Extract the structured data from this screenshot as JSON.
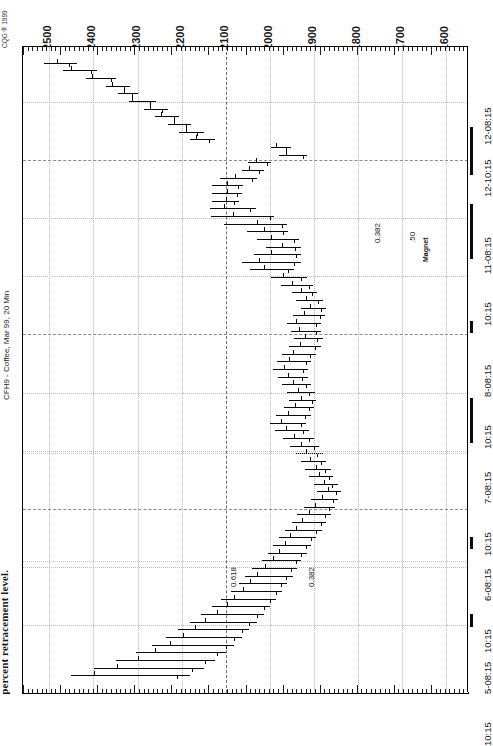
{
  "meta": {
    "copyright": "CQG ® 1999",
    "instrument": "CFH9 - Coffee, Mar 99, 20 Min",
    "caption_fragment": "percent retracement level."
  },
  "chart_data": {
    "type": "bar",
    "subtype": "ohlc-bar-chart-rotated-90",
    "title": "CFH9 - Coffee, Mar 99, 20 Min",
    "xlabel": "",
    "ylabel": "",
    "grid": true,
    "legend": "none",
    "orientation": "rotated-90-ccw",
    "price_axis": {
      "position": "top",
      "labels": [
        "12500",
        "12400",
        "12300",
        "12200",
        "12100",
        "12000",
        "11900",
        "11800",
        "11700",
        "11600"
      ],
      "values": [
        12500,
        12400,
        12300,
        12200,
        12100,
        12000,
        11900,
        11800,
        11700,
        11600
      ],
      "min": 11550,
      "max": 12560
    },
    "time_axis": {
      "position": "right",
      "labels": [
        "12-08:15",
        "12-10:15",
        "11-08:15",
        "10:15",
        "8-08:15",
        "10:15",
        "7-08:15",
        "10:15",
        "6-08:15",
        "10:15",
        "5-08:15",
        "10:15"
      ],
      "sessions": [
        "5-08:15",
        "6-08:15",
        "7-08:15",
        "8-08:15",
        "11-08:15",
        "12-08:15"
      ]
    },
    "annotations": [
      {
        "text": "0.618",
        "kind": "fibonacci-retracement"
      },
      {
        "text": "0.382",
        "kind": "fibonacci-retracement"
      },
      {
        "text": "0.382",
        "kind": "fibonacci-retracement"
      },
      {
        "text": ".50",
        "kind": "fibonacci-retracement"
      },
      {
        "text": "Magnet",
        "kind": "magnet-label"
      }
    ],
    "bars": [
      {
        "t": 0,
        "o": 12482,
        "h": 12512,
        "l": 12437,
        "c": 12455
      },
      {
        "t": 1,
        "o": 12452,
        "h": 12470,
        "l": 12392,
        "c": 12405
      },
      {
        "t": 2,
        "o": 12404,
        "h": 12418,
        "l": 12350,
        "c": 12360
      },
      {
        "t": 3,
        "o": 12358,
        "h": 12372,
        "l": 12318,
        "c": 12330
      },
      {
        "t": 4,
        "o": 12330,
        "h": 12344,
        "l": 12300,
        "c": 12312
      },
      {
        "t": 5,
        "o": 12312,
        "h": 12320,
        "l": 12258,
        "c": 12272
      },
      {
        "t": 6,
        "o": 12272,
        "h": 12285,
        "l": 12232,
        "c": 12245
      },
      {
        "t": 7,
        "o": 12246,
        "h": 12260,
        "l": 12206,
        "c": 12218
      },
      {
        "t": 8,
        "o": 12218,
        "h": 12232,
        "l": 12178,
        "c": 12190
      },
      {
        "t": 9,
        "o": 12190,
        "h": 12205,
        "l": 12150,
        "c": 12166
      },
      {
        "t": 10,
        "o": 12168,
        "h": 12182,
        "l": 12124,
        "c": 12138
      },
      {
        "t": 11,
        "o": 11986,
        "h": 11998,
        "l": 11952,
        "c": 11963
      },
      {
        "t": 12,
        "o": 11964,
        "h": 11980,
        "l": 11916,
        "c": 11925
      },
      {
        "t": 13,
        "o": 12032,
        "h": 12050,
        "l": 11996,
        "c": 12006
      },
      {
        "t": 14,
        "o": 12046,
        "h": 12062,
        "l": 12012,
        "c": 12024
      },
      {
        "t": 15,
        "o": 12078,
        "h": 12112,
        "l": 12030,
        "c": 12040
      },
      {
        "t": 16,
        "o": 12096,
        "h": 12130,
        "l": 12060,
        "c": 12072
      },
      {
        "t": 17,
        "o": 12098,
        "h": 12132,
        "l": 12062,
        "c": 12074
      },
      {
        "t": 18,
        "o": 12100,
        "h": 12130,
        "l": 12070,
        "c": 12080
      },
      {
        "t": 19,
        "o": 12104,
        "h": 12136,
        "l": 12032,
        "c": 12044
      },
      {
        "t": 20,
        "o": 12084,
        "h": 12134,
        "l": 11990,
        "c": 12000
      },
      {
        "t": 21,
        "o": 12030,
        "h": 12104,
        "l": 11960,
        "c": 11972
      },
      {
        "t": 22,
        "o": 12012,
        "h": 12052,
        "l": 11958,
        "c": 11970
      },
      {
        "t": 23,
        "o": 11998,
        "h": 12028,
        "l": 11934,
        "c": 11944
      },
      {
        "t": 24,
        "o": 11972,
        "h": 12008,
        "l": 11930,
        "c": 11942
      },
      {
        "t": 25,
        "o": 11998,
        "h": 12036,
        "l": 11928,
        "c": 11940
      },
      {
        "t": 26,
        "o": 12024,
        "h": 12064,
        "l": 11930,
        "c": 11944
      },
      {
        "t": 27,
        "o": 12014,
        "h": 12044,
        "l": 11946,
        "c": 11958
      },
      {
        "t": 28,
        "o": 11970,
        "h": 11998,
        "l": 11916,
        "c": 11928
      },
      {
        "t": 29,
        "o": 11950,
        "h": 11974,
        "l": 11902,
        "c": 11912
      },
      {
        "t": 30,
        "o": 11928,
        "h": 11950,
        "l": 11892,
        "c": 11904
      },
      {
        "t": 31,
        "o": 11918,
        "h": 11940,
        "l": 11878,
        "c": 11890
      },
      {
        "t": 32,
        "o": 11908,
        "h": 11928,
        "l": 11872,
        "c": 11884
      },
      {
        "t": 33,
        "o": 11922,
        "h": 11948,
        "l": 11874,
        "c": 11886
      },
      {
        "t": 34,
        "o": 11940,
        "h": 11960,
        "l": 11884,
        "c": 11896
      },
      {
        "t": 35,
        "o": 11934,
        "h": 11952,
        "l": 11884,
        "c": 11894
      },
      {
        "t": 36,
        "o": 11920,
        "h": 11944,
        "l": 11880,
        "c": 11892
      },
      {
        "t": 37,
        "o": 11932,
        "h": 11956,
        "l": 11884,
        "c": 11898
      },
      {
        "t": 38,
        "o": 11948,
        "h": 11972,
        "l": 11896,
        "c": 11908
      },
      {
        "t": 39,
        "o": 11956,
        "h": 11984,
        "l": 11906,
        "c": 11918
      },
      {
        "t": 40,
        "o": 11968,
        "h": 11992,
        "l": 11912,
        "c": 11924
      },
      {
        "t": 41,
        "o": 11958,
        "h": 11982,
        "l": 11914,
        "c": 11926
      },
      {
        "t": 42,
        "o": 11948,
        "h": 11972,
        "l": 11906,
        "c": 11918
      },
      {
        "t": 43,
        "o": 11936,
        "h": 11960,
        "l": 11898,
        "c": 11910
      },
      {
        "t": 44,
        "o": 11930,
        "h": 11956,
        "l": 11894,
        "c": 11904
      },
      {
        "t": 45,
        "o": 11942,
        "h": 11968,
        "l": 11900,
        "c": 11912
      },
      {
        "t": 46,
        "o": 11958,
        "h": 11986,
        "l": 11906,
        "c": 11920
      },
      {
        "t": 47,
        "o": 11974,
        "h": 12000,
        "l": 11918,
        "c": 11930
      },
      {
        "t": 48,
        "o": 11962,
        "h": 11988,
        "l": 11912,
        "c": 11924
      },
      {
        "t": 49,
        "o": 11946,
        "h": 11970,
        "l": 11900,
        "c": 11912
      },
      {
        "t": 50,
        "o": 11930,
        "h": 11954,
        "l": 11888,
        "c": 11900
      },
      {
        "t": 51,
        "o": 11918,
        "h": 11942,
        "l": 11880,
        "c": 11892
      },
      {
        "t": 52,
        "o": 11908,
        "h": 11930,
        "l": 11872,
        "c": 11884
      },
      {
        "t": 53,
        "o": 11896,
        "h": 11920,
        "l": 11862,
        "c": 11874
      },
      {
        "t": 54,
        "o": 11888,
        "h": 11912,
        "l": 11856,
        "c": 11866
      },
      {
        "t": 55,
        "o": 11876,
        "h": 11900,
        "l": 11846,
        "c": 11858
      },
      {
        "t": 56,
        "o": 11868,
        "h": 11892,
        "l": 11838,
        "c": 11850
      },
      {
        "t": 57,
        "o": 11882,
        "h": 11906,
        "l": 11844,
        "c": 11856
      },
      {
        "t": 58,
        "o": 11898,
        "h": 11922,
        "l": 11852,
        "c": 11866
      },
      {
        "t": 59,
        "o": 11912,
        "h": 11938,
        "l": 11862,
        "c": 11874
      },
      {
        "t": 60,
        "o": 11926,
        "h": 11950,
        "l": 11872,
        "c": 11884
      },
      {
        "t": 61,
        "o": 11940,
        "h": 11966,
        "l": 11882,
        "c": 11896
      },
      {
        "t": 62,
        "o": 11954,
        "h": 11980,
        "l": 11894,
        "c": 11906
      },
      {
        "t": 63,
        "o": 11966,
        "h": 11992,
        "l": 11906,
        "c": 11918
      },
      {
        "t": 64,
        "o": 11978,
        "h": 12004,
        "l": 11916,
        "c": 11928
      },
      {
        "t": 65,
        "o": 11992,
        "h": 12018,
        "l": 11928,
        "c": 11940
      },
      {
        "t": 66,
        "o": 12010,
        "h": 12040,
        "l": 11938,
        "c": 11952
      },
      {
        "t": 67,
        "o": 12028,
        "h": 12056,
        "l": 11948,
        "c": 11962
      },
      {
        "t": 68,
        "o": 12044,
        "h": 12070,
        "l": 11960,
        "c": 11974
      },
      {
        "t": 69,
        "o": 12060,
        "h": 12088,
        "l": 11972,
        "c": 11986
      },
      {
        "t": 70,
        "o": 12080,
        "h": 12110,
        "l": 11986,
        "c": 12000
      },
      {
        "t": 71,
        "o": 12098,
        "h": 12132,
        "l": 12000,
        "c": 12014
      },
      {
        "t": 72,
        "o": 12120,
        "h": 12156,
        "l": 12014,
        "c": 12030
      },
      {
        "t": 73,
        "o": 12146,
        "h": 12182,
        "l": 12030,
        "c": 12046
      },
      {
        "t": 74,
        "o": 12170,
        "h": 12208,
        "l": 12046,
        "c": 12062
      },
      {
        "t": 75,
        "o": 12196,
        "h": 12236,
        "l": 12062,
        "c": 12080
      },
      {
        "t": 76,
        "o": 12226,
        "h": 12268,
        "l": 12080,
        "c": 12100
      },
      {
        "t": 77,
        "o": 12260,
        "h": 12304,
        "l": 12100,
        "c": 12120
      },
      {
        "t": 78,
        "o": 12300,
        "h": 12348,
        "l": 12124,
        "c": 12146
      },
      {
        "t": 79,
        "o": 12346,
        "h": 12398,
        "l": 12150,
        "c": 12176
      },
      {
        "t": 80,
        "o": 12398,
        "h": 12452,
        "l": 12180,
        "c": 12210
      }
    ]
  }
}
